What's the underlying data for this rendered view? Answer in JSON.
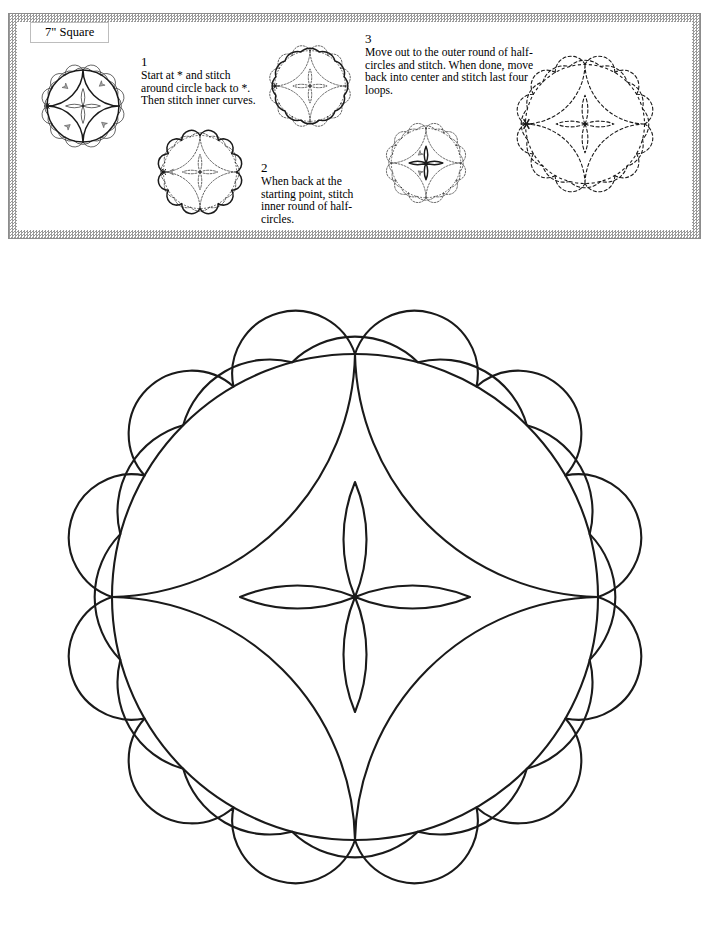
{
  "page": {
    "background_color": "#ffffff",
    "ink_color": "#1a1a1a",
    "border_color": "#9a9a9a",
    "width": 717,
    "height": 947
  },
  "title_box": {
    "label": "7\" Square"
  },
  "instructions": [
    {
      "number": "1",
      "text": "Start at * and stitch around circle back to *. Then stitch inner curves."
    },
    {
      "number": "2",
      "text": "When back at the starting point, stitch inner round of half-circles."
    },
    {
      "number": "3",
      "text": "Move out to the outer round of half-circles and stitch. When done, move back into center and stitch last four loops."
    }
  ],
  "step_figures": [
    {
      "name": "figure-step-1",
      "caption": "main circle and four inner curves highlighted, start marker at left",
      "highlight": "circle-and-inner-curves",
      "start_marker": true,
      "arrows": 4
    },
    {
      "name": "figure-step-2",
      "caption": "inner round of half-circles highlighted",
      "highlight": "inner-scallops",
      "start_marker": true,
      "arrows": 1
    },
    {
      "name": "figure-step-3",
      "caption": "outer round of half-circles highlighted",
      "highlight": "outer-scallops",
      "start_marker": true,
      "arrows": 0
    },
    {
      "name": "figure-step-4",
      "caption": "four center loops highlighted",
      "highlight": "center-petals",
      "start_marker": false,
      "arrows": 2
    },
    {
      "name": "figure-step-5",
      "caption": "complete pattern shown as construction lines",
      "highlight": "none",
      "start_marker": true,
      "arrows": 0
    }
  ],
  "pattern_geometry": {
    "center_x": 355,
    "center_y": 354,
    "main_circle_radius": 243,
    "inner_scallop_count": 12,
    "inner_scallop_radius": 63,
    "outer_scallop_count": 12,
    "outer_scallop_radius": 90,
    "outer_scallop_center_radius": 243,
    "center_petal_count": 4,
    "center_petal_length": 115,
    "center_petal_width": 54,
    "quadrant_arc_count": 4,
    "stroke_width": 2
  }
}
